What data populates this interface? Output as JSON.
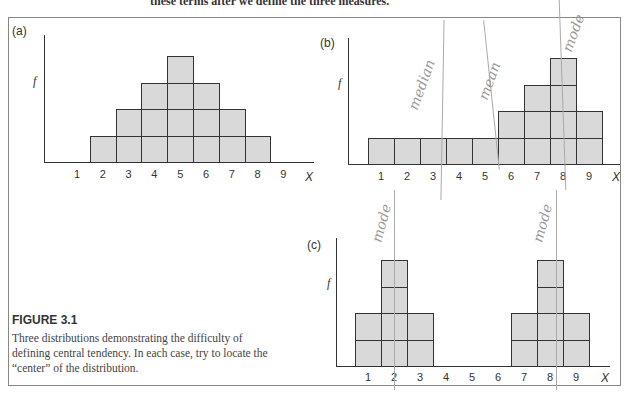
{
  "page": {
    "top_text": "these terms after we define the three measures."
  },
  "figure": {
    "title": "FIGURE 3.1",
    "caption": "Three distributions demonstrating the difficulty of defining central tendency. In each case, try to locate the “center” of the distribution."
  },
  "annotations": {
    "b_median": "median",
    "b_mean": "mean",
    "b_mode": "mode",
    "c_mode_left": "mode",
    "c_mode_right": "mode"
  },
  "chart_data": [
    {
      "type": "bar",
      "panel": "(a)",
      "title": "(a)",
      "xlabel": "X",
      "ylabel": "f",
      "categories": [
        "1",
        "2",
        "3",
        "4",
        "5",
        "6",
        "7",
        "8",
        "9"
      ],
      "values": [
        0,
        1,
        2,
        3,
        4,
        3,
        2,
        1,
        0
      ],
      "style": "stacked unit squares (histogram blocks)",
      "grid": false
    },
    {
      "type": "bar",
      "panel": "(b)",
      "title": "(b)",
      "xlabel": "X",
      "ylabel": "f",
      "categories": [
        "1",
        "2",
        "3",
        "4",
        "5",
        "6",
        "7",
        "8",
        "9"
      ],
      "values": [
        1,
        1,
        1,
        1,
        1,
        2,
        3,
        4,
        2
      ],
      "style": "stacked unit squares (histogram blocks)",
      "annotations": [
        "median (handwritten, near X=3.5)",
        "mean (handwritten, near X=5.5)",
        "mode (handwritten, near X=8)"
      ],
      "grid": false
    },
    {
      "type": "bar",
      "panel": "(c)",
      "title": "(c)",
      "xlabel": "X",
      "ylabel": "f",
      "categories": [
        "1",
        "2",
        "3",
        "4",
        "5",
        "6",
        "7",
        "8",
        "9"
      ],
      "values": [
        2,
        4,
        2,
        0,
        0,
        0,
        2,
        4,
        2
      ],
      "style": "stacked unit squares (histogram blocks)",
      "annotations": [
        "mode (handwritten, at X=2)",
        "mode (handwritten, at X=8)"
      ],
      "grid": false
    }
  ]
}
